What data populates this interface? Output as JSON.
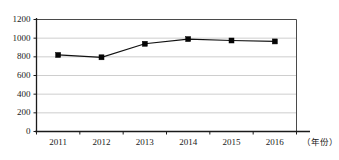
{
  "chart_data": {
    "type": "line",
    "title": "",
    "xlabel": "（年份）",
    "ylabel": "",
    "categories": [
      "2011",
      "2012",
      "2013",
      "2014",
      "2015",
      "2016"
    ],
    "values": [
      820,
      795,
      940,
      990,
      975,
      965
    ],
    "series": [
      {
        "name": "",
        "values": [
          820,
          795,
          940,
          990,
          975,
          965
        ]
      }
    ],
    "ylim": [
      0,
      1200
    ],
    "ytick_labels": [
      "0",
      "200",
      "400",
      "600",
      "800",
      "1000",
      "1200"
    ],
    "ytick_values": [
      0,
      200,
      400,
      600,
      800,
      1000,
      1200
    ],
    "xtick_labels": [
      "2011",
      "2012",
      "2013",
      "2014",
      "2015",
      "2016"
    ],
    "grid": "horizontal",
    "legend": "none",
    "marker": "square",
    "colors": {
      "series": "#050505",
      "grid": "#b9b9b9",
      "axis": "#1a1a1a",
      "frame": "#4a4a4a",
      "background": "#ffffff"
    }
  }
}
